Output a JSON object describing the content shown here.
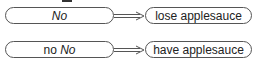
{
  "rows": [
    {
      "left": {
        "plain": "",
        "italic": "No"
      },
      "right": "lose applesauce"
    },
    {
      "left": {
        "plain": "no ",
        "italic": "No"
      },
      "right": "have applesauce"
    }
  ],
  "arrow": "double-arrow"
}
